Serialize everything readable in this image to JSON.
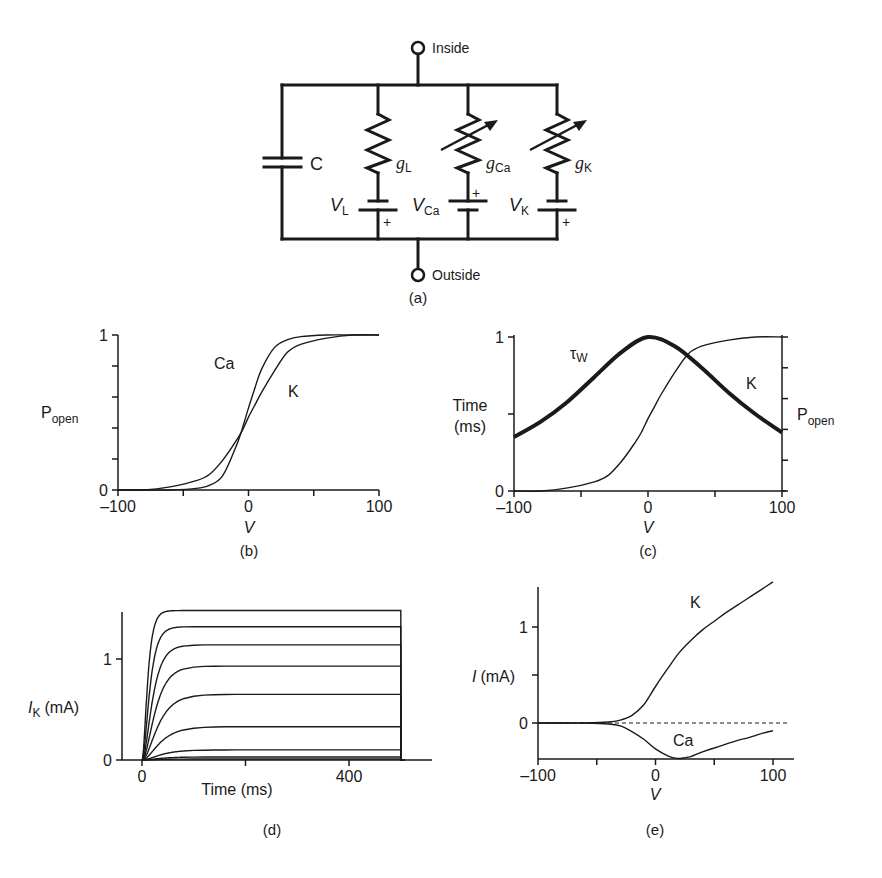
{
  "figure": {
    "panel_labels": {
      "a": "(a)",
      "b": "(b)",
      "c": "(c)",
      "d": "(d)",
      "e": "(e)"
    },
    "circuit": {
      "inside_label": "Inside",
      "outside_label": "Outside",
      "capacitor_label": "C",
      "branches": [
        {
          "id": "L",
          "conductance": "g",
          "conductance_sub": "L",
          "reversal": "V",
          "reversal_sub": "L",
          "variable": false,
          "battery_plus": "bottom"
        },
        {
          "id": "Ca",
          "conductance": "g",
          "conductance_sub": "Ca",
          "reversal": "V",
          "reversal_sub": "Ca",
          "variable": true,
          "battery_plus": "top"
        },
        {
          "id": "K",
          "conductance": "g",
          "conductance_sub": "K",
          "reversal": "V",
          "reversal_sub": "K",
          "variable": true,
          "battery_plus": "bottom"
        }
      ],
      "plus_sign": "+"
    }
  },
  "chart_data": [
    {
      "panel": "b",
      "type": "line",
      "title": "",
      "xlabel": "V",
      "ylabel": "P",
      "ylabel_sub": "open",
      "xlim": [
        -100,
        100
      ],
      "ylim": [
        0,
        1
      ],
      "xticks": [
        -100,
        -50,
        0,
        50,
        100
      ],
      "xtick_labels": [
        "–100",
        "",
        "0",
        "",
        "100"
      ],
      "yticks": [
        0,
        0.2,
        0.4,
        0.6,
        0.8,
        1
      ],
      "ytick_labels": [
        "0",
        "",
        "",
        "",
        "",
        "1"
      ],
      "grid": false,
      "series": [
        {
          "name": "Ca",
          "x": [
            -100,
            -80,
            -60,
            -40,
            -30,
            -20,
            -10,
            -5,
            0,
            5,
            10,
            20,
            30,
            40,
            60,
            80,
            100
          ],
          "values": [
            0.0,
            0.0,
            0.0,
            0.01,
            0.03,
            0.09,
            0.27,
            0.39,
            0.53,
            0.66,
            0.78,
            0.92,
            0.97,
            0.99,
            1.0,
            1.0,
            1.0
          ]
        },
        {
          "name": "K",
          "x": [
            -100,
            -80,
            -60,
            -40,
            -30,
            -20,
            -10,
            -5,
            0,
            5,
            10,
            20,
            30,
            40,
            60,
            80,
            100
          ],
          "values": [
            0.0,
            0.0,
            0.02,
            0.06,
            0.1,
            0.19,
            0.31,
            0.38,
            0.47,
            0.55,
            0.63,
            0.77,
            0.89,
            0.94,
            0.98,
            1.0,
            1.0
          ]
        }
      ],
      "annotations": [
        "Ca",
        "K"
      ]
    },
    {
      "panel": "c",
      "type": "line",
      "title": "",
      "xlabel": "V",
      "ylabel": "Time\n(ms)",
      "ylabel_right": "P",
      "ylabel_right_sub": "open",
      "xlim": [
        -100,
        100
      ],
      "ylim": [
        0,
        1
      ],
      "xticks": [
        -100,
        -50,
        0,
        50,
        100
      ],
      "xtick_labels": [
        "–100",
        "",
        "0",
        "",
        "100"
      ],
      "yticks": [
        0,
        0.5,
        1
      ],
      "ytick_labels": [
        "0",
        "",
        "1"
      ],
      "right_yticks": [
        0,
        0.2,
        0.4,
        0.6,
        0.8,
        1
      ],
      "grid": false,
      "series": [
        {
          "name": "τW",
          "axis": "left",
          "style": "thick",
          "x": [
            -100,
            -80,
            -60,
            -40,
            -20,
            0,
            20,
            40,
            60,
            80,
            100
          ],
          "values": [
            0.35,
            0.45,
            0.58,
            0.74,
            0.9,
            1.0,
            0.94,
            0.8,
            0.64,
            0.5,
            0.38
          ]
        },
        {
          "name": "K",
          "axis": "right",
          "style": "thin",
          "x": [
            -100,
            -80,
            -60,
            -40,
            -30,
            -20,
            -10,
            -5,
            0,
            5,
            10,
            20,
            30,
            40,
            60,
            80,
            100
          ],
          "values": [
            0.0,
            0.0,
            0.02,
            0.06,
            0.1,
            0.19,
            0.31,
            0.38,
            0.47,
            0.55,
            0.63,
            0.77,
            0.89,
            0.94,
            0.98,
            1.0,
            1.0
          ]
        }
      ],
      "annotations": [
        "τW",
        "K"
      ]
    },
    {
      "panel": "d",
      "type": "line",
      "title": "",
      "xlabel": "Time (ms)",
      "ylabel": "I",
      "ylabel_sub": "K",
      "ylabel_units": "(mA)",
      "xlim": [
        -30,
        560
      ],
      "ylim": [
        0,
        1.55
      ],
      "xticks": [
        0,
        200,
        400
      ],
      "xtick_labels": [
        "0",
        "",
        "400"
      ],
      "yticks": [
        0,
        1
      ],
      "ytick_labels": [
        "0",
        "1"
      ],
      "grid": false,
      "step_onset_ms": 0,
      "step_offset_ms": 500,
      "series": [
        {
          "name": "step 1",
          "steady_state": 1.48,
          "tau_ms": 8
        },
        {
          "name": "step 2",
          "steady_state": 1.32,
          "tau_ms": 11
        },
        {
          "name": "step 3",
          "steady_state": 1.14,
          "tau_ms": 15
        },
        {
          "name": "step 4",
          "steady_state": 0.93,
          "tau_ms": 19
        },
        {
          "name": "step 5",
          "steady_state": 0.65,
          "tau_ms": 23
        },
        {
          "name": "step 6",
          "steady_state": 0.33,
          "tau_ms": 26
        },
        {
          "name": "step 7",
          "steady_state": 0.1,
          "tau_ms": 27
        },
        {
          "name": "step 8",
          "steady_state": 0.03,
          "tau_ms": 26
        },
        {
          "name": "step 9",
          "steady_state": 0.01,
          "tau_ms": 24
        }
      ]
    },
    {
      "panel": "e",
      "type": "line",
      "title": "",
      "xlabel": "V",
      "ylabel": "I",
      "ylabel_units": "(mA)",
      "xlim": [
        -100,
        110
      ],
      "ylim": [
        -0.37,
        1.6
      ],
      "xticks": [
        -100,
        -50,
        0,
        50,
        100
      ],
      "xtick_labels": [
        "–100",
        "",
        "0",
        "",
        "100"
      ],
      "yticks": [
        0,
        0.5,
        1
      ],
      "ytick_labels": [
        "0",
        "",
        "1"
      ],
      "grid": false,
      "zero_line": "dashed",
      "series": [
        {
          "name": "K",
          "x": [
            -100,
            -80,
            -60,
            -40,
            -30,
            -20,
            -10,
            0,
            10,
            20,
            30,
            40,
            50,
            60,
            70,
            80,
            90,
            100
          ],
          "values": [
            0.0,
            0.0,
            0.0,
            0.01,
            0.03,
            0.08,
            0.19,
            0.38,
            0.56,
            0.73,
            0.86,
            0.97,
            1.06,
            1.15,
            1.23,
            1.31,
            1.39,
            1.47
          ]
        },
        {
          "name": "Ca",
          "x": [
            -100,
            -80,
            -60,
            -40,
            -30,
            -20,
            -10,
            0,
            10,
            15,
            20,
            25,
            30,
            40,
            50,
            60,
            70,
            80,
            90,
            100
          ],
          "values": [
            0.0,
            0.0,
            0.0,
            -0.01,
            -0.03,
            -0.09,
            -0.17,
            -0.27,
            -0.34,
            -0.36,
            -0.37,
            -0.36,
            -0.35,
            -0.3,
            -0.26,
            -0.22,
            -0.18,
            -0.15,
            -0.11,
            -0.08
          ]
        }
      ],
      "annotations": [
        "K",
        "Ca"
      ]
    }
  ]
}
